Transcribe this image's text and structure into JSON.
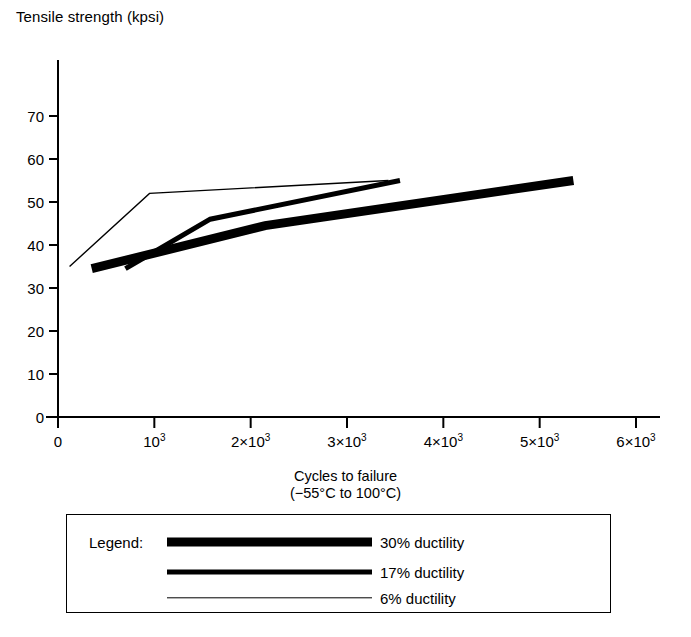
{
  "axes": {
    "y_title": "Tensile strength (kpsi)",
    "x_title_line1": "Cycles to failure",
    "x_title_line2": "(−55°C to 100°C)",
    "y_ticks": [
      "0",
      "10",
      "20",
      "30",
      "40",
      "50",
      "60",
      "70"
    ],
    "x_ticks": [
      "0",
      "10³",
      "2×10³",
      "3×10³",
      "4×10³",
      "5×10³",
      "6×10³"
    ]
  },
  "legend": {
    "title": "Legend:",
    "entries": [
      {
        "label": "30% ductility",
        "thickness": 9
      },
      {
        "label": "17% ductility",
        "thickness": 5
      },
      {
        "label": "6% ductility",
        "thickness": 1.4
      }
    ]
  },
  "chart_data": {
    "type": "line",
    "title": "",
    "xlabel": "Cycles to failure (−55°C to 100°C)",
    "ylabel": "Tensile strength (kpsi)",
    "xlim": [
      0,
      6200
    ],
    "ylim": [
      0,
      75
    ],
    "xticks": [
      0,
      1000,
      2000,
      3000,
      4000,
      5000,
      6000
    ],
    "yticks": [
      0,
      10,
      20,
      30,
      40,
      50,
      60,
      70
    ],
    "grid": false,
    "legend_position": "below-plot",
    "color": "#000000",
    "series": [
      {
        "name": "30% ductility",
        "linewidth": 9,
        "x": [
          350,
          2150,
          5350
        ],
        "y": [
          34.5,
          44.5,
          55.0
        ]
      },
      {
        "name": "17% ductility",
        "linewidth": 5,
        "x": [
          700,
          1580,
          3550
        ],
        "y": [
          34.5,
          46.0,
          55.0
        ]
      },
      {
        "name": "6% ductility",
        "linewidth": 1.4,
        "x": [
          120,
          950,
          3430
        ],
        "y": [
          35.0,
          52.0,
          55.0
        ]
      }
    ]
  }
}
